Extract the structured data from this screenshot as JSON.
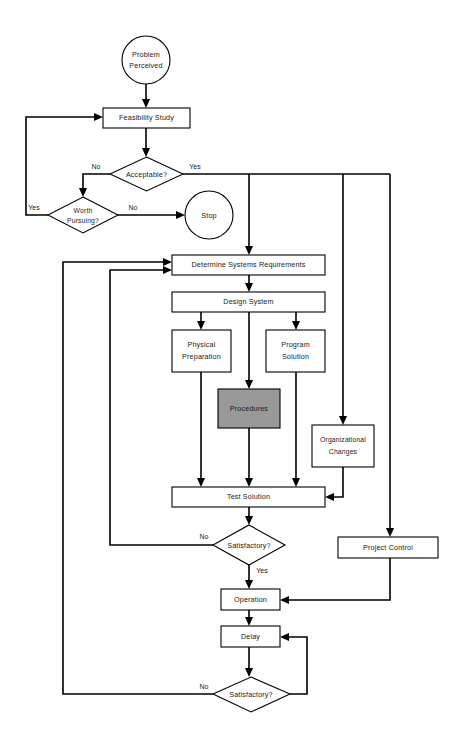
{
  "diagram": {
    "canvas": {
      "width": 462,
      "height": 746
    },
    "colors": {
      "background": "#ffffff",
      "stroke": "#000000",
      "node_fill": "#ffffff",
      "shaded_fill": "#999999",
      "text": "#1a1a1a"
    },
    "nodes": {
      "problem_perceived": {
        "label_line1": "Problem",
        "label_line2": "Perceived",
        "shape": "circle"
      },
      "feasibility_study": {
        "label": "Feasibility Study",
        "shape": "rectangle"
      },
      "acceptable": {
        "label": "Acceptable?",
        "shape": "diamond"
      },
      "worth_pursuing": {
        "label_line1": "Worth",
        "label_line2": "Pursuing?",
        "shape": "diamond"
      },
      "stop": {
        "label": "Stop",
        "shape": "circle"
      },
      "determine_systems_requirements": {
        "label": "Determine Systems Requirements",
        "shape": "rectangle"
      },
      "design_system": {
        "label": "Design System",
        "shape": "rectangle"
      },
      "physical_preparation": {
        "label_line1": "Physical",
        "label_line2": "Preparation",
        "shape": "rectangle"
      },
      "program_solution": {
        "label_line1": "Program",
        "label_line2": "Solution",
        "shape": "rectangle"
      },
      "procedures": {
        "label": "Procedures",
        "shape": "rectangle",
        "fill": "#999999"
      },
      "organizational_changes": {
        "label_line1": "Organizational",
        "label_line2": "Changes",
        "shape": "rectangle"
      },
      "test_solution": {
        "label": "Test Solution",
        "shape": "rectangle"
      },
      "satisfactory_test": {
        "label": "Satisfactory?",
        "shape": "diamond"
      },
      "project_control": {
        "label": "Project Control",
        "shape": "rectangle"
      },
      "operation": {
        "label": "Operation",
        "shape": "rectangle"
      },
      "delay": {
        "label": "Delay",
        "shape": "rectangle"
      },
      "satisfactory_operation": {
        "label": "Satisfactory?",
        "shape": "diamond"
      }
    },
    "edge_labels": {
      "acceptable_no": "No",
      "acceptable_yes": "Yes",
      "worth_pursuing_yes": "Yes",
      "worth_pursuing_no": "No",
      "satisfactory_test_no": "No",
      "satisfactory_test_yes": "Yes",
      "satisfactory_operation_no": "No"
    }
  }
}
